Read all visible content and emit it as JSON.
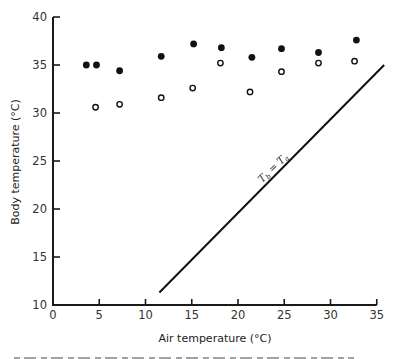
{
  "chart_data": {
    "type": "scatter",
    "title": "",
    "xlabel": "Air temperature (°C)",
    "ylabel": "Body temperature (°C)",
    "xlim": [
      0,
      35
    ],
    "ylim": [
      10,
      40
    ],
    "x_ticks": [
      0,
      5,
      10,
      15,
      20,
      25,
      30,
      35
    ],
    "y_ticks": [
      10,
      15,
      20,
      25,
      30,
      35,
      40
    ],
    "grid": false,
    "legend": null,
    "series": [
      {
        "name": "filled circles",
        "marker": "filled-circle",
        "points": [
          {
            "x": 3.6,
            "y": 35.0
          },
          {
            "x": 4.7,
            "y": 35.0
          },
          {
            "x": 7.2,
            "y": 34.4
          },
          {
            "x": 11.7,
            "y": 35.9
          },
          {
            "x": 15.2,
            "y": 37.2
          },
          {
            "x": 18.2,
            "y": 36.8
          },
          {
            "x": 21.5,
            "y": 35.8
          },
          {
            "x": 24.7,
            "y": 36.7
          },
          {
            "x": 28.7,
            "y": 36.3
          },
          {
            "x": 32.8,
            "y": 37.6
          }
        ]
      },
      {
        "name": "open circles",
        "marker": "open-circle",
        "points": [
          {
            "x": 4.6,
            "y": 30.6
          },
          {
            "x": 7.2,
            "y": 30.9
          },
          {
            "x": 11.7,
            "y": 31.6
          },
          {
            "x": 15.1,
            "y": 32.6
          },
          {
            "x": 18.1,
            "y": 35.2
          },
          {
            "x": 21.3,
            "y": 32.2
          },
          {
            "x": 24.7,
            "y": 34.3
          },
          {
            "x": 28.7,
            "y": 35.2
          },
          {
            "x": 32.6,
            "y": 35.4
          }
        ]
      },
      {
        "name": "Tb = Ta",
        "type": "line",
        "points": [
          {
            "x": 11.5,
            "y": 11.3
          },
          {
            "x": 35.8,
            "y": 35.0
          }
        ]
      }
    ],
    "annotations": [
      {
        "text_main": "T",
        "sub1": "b",
        "eq": " = ",
        "text_main2": "T",
        "sub2": "a",
        "position": "along diagonal line"
      }
    ]
  }
}
